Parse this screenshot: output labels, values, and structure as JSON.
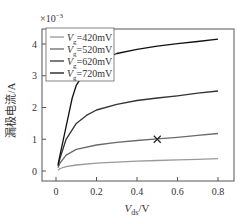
{
  "chart_data": {
    "type": "line",
    "title": "",
    "xlabel": "V_ds/V",
    "ylabel": "漏极电流/A",
    "y_multiplier": "×10⁻³",
    "xlim": [
      -0.04,
      0.86
    ],
    "ylim": [
      -0.4,
      4.5
    ],
    "xticks": [
      0,
      0.2,
      0.4,
      0.6,
      0.8
    ],
    "xtick_labels": [
      "0",
      "0.2",
      "0.4",
      "0.6",
      "0.8"
    ],
    "yticks": [
      0,
      1,
      2,
      3,
      4
    ],
    "ytick_labels": [
      "0",
      "1",
      "2",
      "3",
      "4"
    ],
    "grid": false,
    "legend_position": "upper left",
    "series": [
      {
        "name": "Vg=420mV",
        "color": "#9a9a9a",
        "x": [
          0.01,
          0.02,
          0.05,
          0.1,
          0.2,
          0.3,
          0.4,
          0.5,
          0.6,
          0.7,
          0.8
        ],
        "y": [
          0.02,
          0.08,
          0.14,
          0.19,
          0.25,
          0.28,
          0.31,
          0.33,
          0.35,
          0.37,
          0.39
        ]
      },
      {
        "name": "Vg=520mV",
        "color": "#6a6a6a",
        "x": [
          0.01,
          0.02,
          0.05,
          0.1,
          0.2,
          0.3,
          0.4,
          0.5,
          0.6,
          0.7,
          0.8
        ],
        "y": [
          0.1,
          0.25,
          0.5,
          0.68,
          0.82,
          0.9,
          0.96,
          1.01,
          1.06,
          1.12,
          1.18
        ]
      },
      {
        "name": "Vg=620mV",
        "color": "#333333",
        "x": [
          0.01,
          0.02,
          0.05,
          0.1,
          0.15,
          0.2,
          0.3,
          0.4,
          0.5,
          0.6,
          0.7,
          0.8
        ],
        "y": [
          0.15,
          0.4,
          1.0,
          1.5,
          1.75,
          1.92,
          2.1,
          2.22,
          2.3,
          2.37,
          2.45,
          2.52
        ]
      },
      {
        "name": "Vg=720mV",
        "color": "#111111",
        "x": [
          0.01,
          0.02,
          0.05,
          0.08,
          0.1,
          0.15,
          0.2,
          0.3,
          0.4,
          0.5,
          0.6,
          0.7,
          0.8
        ],
        "y": [
          0.2,
          0.5,
          1.4,
          2.3,
          2.7,
          3.2,
          3.45,
          3.7,
          3.83,
          3.93,
          4.01,
          4.08,
          4.15
        ]
      }
    ],
    "annotations": [
      {
        "type": "marker",
        "symbol": "×",
        "x": 0.5,
        "y": 1.0,
        "series": "Vg=520mV"
      }
    ]
  },
  "legend": {
    "items": [
      {
        "prefix": "V",
        "sub": "g",
        "value": "=420mV",
        "color": "#9a9a9a"
      },
      {
        "prefix": "V",
        "sub": "g",
        "value": "=520mV",
        "color": "#6a6a6a"
      },
      {
        "prefix": "V",
        "sub": "g",
        "value": "=620mV",
        "color": "#333333"
      },
      {
        "prefix": "V",
        "sub": "g",
        "value": "=720mV",
        "color": "#111111"
      }
    ]
  },
  "axes": {
    "multiplier_prefix": "×10",
    "multiplier_exp": "−3",
    "xlabel_main": "V",
    "xlabel_sub": "ds",
    "xlabel_unit": "/V",
    "ylabel": "漏极电流/A"
  }
}
